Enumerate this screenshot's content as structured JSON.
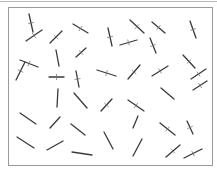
{
  "diagram": {
    "type": "needle-drop",
    "frame": {
      "x": 8,
      "y": 7,
      "width": 205,
      "height": 159,
      "border_color": "#9a9a9a"
    },
    "needle_color": "#3a3a3a",
    "needles": [
      {
        "x1": 29,
        "y1": 14,
        "x2": 33,
        "y2": 32,
        "crossed": true
      },
      {
        "x1": 26,
        "y1": 41,
        "x2": 42,
        "y2": 30,
        "crossed": true
      },
      {
        "x1": 50,
        "y1": 43,
        "x2": 62,
        "y2": 31,
        "crossed": true
      },
      {
        "x1": 73,
        "y1": 24,
        "x2": 88,
        "y2": 33,
        "crossed": true
      },
      {
        "x1": 108,
        "y1": 28,
        "x2": 112,
        "y2": 46,
        "crossed": true
      },
      {
        "x1": 120,
        "y1": 45,
        "x2": 137,
        "y2": 40,
        "crossed": true
      },
      {
        "x1": 130,
        "y1": 20,
        "x2": 144,
        "y2": 33,
        "crossed": true
      },
      {
        "x1": 76,
        "y1": 57,
        "x2": 86,
        "y2": 48,
        "crossed": true
      },
      {
        "x1": 152,
        "y1": 22,
        "x2": 165,
        "y2": 33,
        "crossed": true
      },
      {
        "x1": 150,
        "y1": 38,
        "x2": 156,
        "y2": 53,
        "crossed": true
      },
      {
        "x1": 190,
        "y1": 21,
        "x2": 196,
        "y2": 38,
        "crossed": true
      },
      {
        "x1": 20,
        "y1": 60,
        "x2": 38,
        "y2": 67,
        "crossed": true
      },
      {
        "x1": 16,
        "y1": 80,
        "x2": 25,
        "y2": 62,
        "crossed": true
      },
      {
        "x1": 56,
        "y1": 50,
        "x2": 59,
        "y2": 66,
        "crossed": false
      },
      {
        "x1": 49,
        "y1": 77,
        "x2": 64,
        "y2": 77,
        "crossed": true
      },
      {
        "x1": 76,
        "y1": 71,
        "x2": 79,
        "y2": 87,
        "crossed": true
      },
      {
        "x1": 97,
        "y1": 70,
        "x2": 116,
        "y2": 76,
        "crossed": true
      },
      {
        "x1": 128,
        "y1": 79,
        "x2": 140,
        "y2": 65,
        "crossed": true
      },
      {
        "x1": 152,
        "y1": 76,
        "x2": 168,
        "y2": 66,
        "crossed": true
      },
      {
        "x1": 183,
        "y1": 55,
        "x2": 195,
        "y2": 68,
        "crossed": true
      },
      {
        "x1": 191,
        "y1": 79,
        "x2": 206,
        "y2": 69,
        "crossed": true
      },
      {
        "x1": 193,
        "y1": 90,
        "x2": 207,
        "y2": 81,
        "crossed": true
      },
      {
        "x1": 161,
        "y1": 88,
        "x2": 174,
        "y2": 99,
        "crossed": false
      },
      {
        "x1": 58,
        "y1": 89,
        "x2": 57,
        "y2": 107,
        "crossed": false
      },
      {
        "x1": 74,
        "y1": 93,
        "x2": 87,
        "y2": 108,
        "crossed": false
      },
      {
        "x1": 101,
        "y1": 111,
        "x2": 112,
        "y2": 99,
        "crossed": true
      },
      {
        "x1": 128,
        "y1": 100,
        "x2": 144,
        "y2": 111,
        "crossed": true
      },
      {
        "x1": 133,
        "y1": 128,
        "x2": 138,
        "y2": 116,
        "crossed": false
      },
      {
        "x1": 20,
        "y1": 113,
        "x2": 36,
        "y2": 124,
        "crossed": false
      },
      {
        "x1": 50,
        "y1": 128,
        "x2": 60,
        "y2": 117,
        "crossed": false
      },
      {
        "x1": 71,
        "y1": 124,
        "x2": 85,
        "y2": 135,
        "crossed": false
      },
      {
        "x1": 17,
        "y1": 137,
        "x2": 34,
        "y2": 148,
        "crossed": false
      },
      {
        "x1": 47,
        "y1": 150,
        "x2": 63,
        "y2": 141,
        "crossed": false
      },
      {
        "x1": 72,
        "y1": 152,
        "x2": 92,
        "y2": 155,
        "crossed": false
      },
      {
        "x1": 104,
        "y1": 132,
        "x2": 113,
        "y2": 149,
        "crossed": false
      },
      {
        "x1": 133,
        "y1": 156,
        "x2": 142,
        "y2": 139,
        "crossed": false
      },
      {
        "x1": 160,
        "y1": 123,
        "x2": 175,
        "y2": 135,
        "crossed": true
      },
      {
        "x1": 187,
        "y1": 121,
        "x2": 193,
        "y2": 134,
        "crossed": true
      },
      {
        "x1": 166,
        "y1": 157,
        "x2": 180,
        "y2": 145,
        "crossed": true
      },
      {
        "x1": 184,
        "y1": 158,
        "x2": 202,
        "y2": 149,
        "crossed": true
      }
    ]
  }
}
